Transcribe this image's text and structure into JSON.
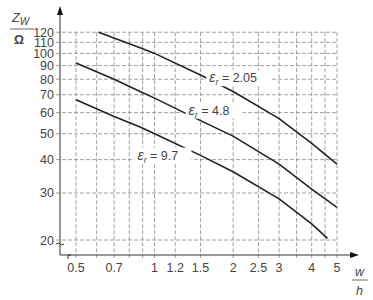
{
  "chart_data": {
    "type": "line",
    "title": "",
    "xlabel": "w/h",
    "ylabel": "Z_W/Ω",
    "xlabel_num": "w",
    "xlabel_den": "h",
    "ylabel_main": "Z",
    "ylabel_sub": "W",
    "ylabel_den": "Ω",
    "xscale": "log",
    "yscale": "log",
    "xlim": [
      0.5,
      5
    ],
    "ylim": [
      20,
      120
    ],
    "grid": true,
    "x_ticks": [
      {
        "v": 0.5,
        "label": "0.5"
      },
      {
        "v": 0.7,
        "label": "0.7"
      },
      {
        "v": 1,
        "label": "1"
      },
      {
        "v": 1.2,
        "label": "1.2"
      },
      {
        "v": 1.5,
        "label": "1.5"
      },
      {
        "v": 2,
        "label": "2"
      },
      {
        "v": 2.5,
        "label": "2.5"
      },
      {
        "v": 3,
        "label": "3"
      },
      {
        "v": 4,
        "label": "4"
      },
      {
        "v": 5,
        "label": "5"
      }
    ],
    "x_gridlines": [
      0.5,
      0.6,
      0.7,
      0.8,
      0.9,
      1,
      1.2,
      1.5,
      2,
      2.5,
      3,
      3.5,
      4,
      4.5,
      5
    ],
    "y_ticks": [
      {
        "v": 20,
        "label": "20"
      },
      {
        "v": 30,
        "label": "30"
      },
      {
        "v": 40,
        "label": "40"
      },
      {
        "v": 50,
        "label": "50"
      },
      {
        "v": 60,
        "label": "60"
      },
      {
        "v": 70,
        "label": "70"
      },
      {
        "v": 80,
        "label": "80"
      },
      {
        "v": 90,
        "label": "90"
      },
      {
        "v": 100,
        "label": "100"
      },
      {
        "v": 110,
        "label": "110"
      },
      {
        "v": 120,
        "label": "120"
      }
    ],
    "series": [
      {
        "name": "εr = 2.05",
        "label_sym": "ε",
        "label_sub": "r",
        "label_val": "= 2.05",
        "x": [
          0.61,
          0.88,
          1.0,
          1.5,
          2.0,
          3.0,
          4.0,
          5.0
        ],
        "y": [
          120,
          105,
          100,
          83,
          72,
          57,
          46,
          38.5
        ],
        "label_pos": [
          1.62,
          78
        ]
      },
      {
        "name": "εr = 4.8",
        "label_sym": "ε",
        "label_sub": "r",
        "label_val": "= 4.8",
        "x": [
          0.5,
          0.7,
          0.88,
          1.0,
          1.5,
          2.0,
          3.0,
          4.0,
          5.0
        ],
        "y": [
          92,
          80,
          72,
          68,
          56,
          49,
          38.5,
          31,
          26.5
        ],
        "label_pos": [
          1.35,
          59
        ]
      },
      {
        "name": "εr = 9.7",
        "label_sym": "ε",
        "label_sub": "r",
        "label_val": "= 9.7",
        "x": [
          0.5,
          0.7,
          0.88,
          1.0,
          1.5,
          2.0,
          3.0,
          4.0,
          4.6
        ],
        "y": [
          67,
          58,
          53,
          50,
          41.5,
          36,
          28.5,
          23,
          20.3
        ],
        "label_pos": [
          0.86,
          40
        ]
      }
    ]
  }
}
